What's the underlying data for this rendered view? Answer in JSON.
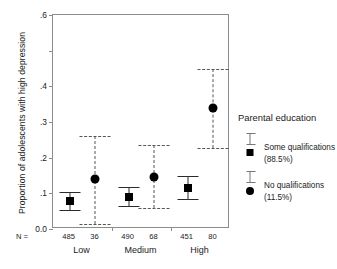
{
  "chart_data": {
    "type": "scatter",
    "title": "",
    "xlabel": "",
    "ylabel": "Proportion of adolescents with high depression",
    "categories": [
      "Low",
      "Medium",
      "High"
    ],
    "ylim": [
      0.0,
      0.6
    ],
    "yticks": [
      "0.0",
      ".1",
      ".2",
      ".3",
      ".4",
      ".6"
    ],
    "ytick_values": [
      0.0,
      0.1,
      0.2,
      0.3,
      0.4,
      0.6
    ],
    "grid": false,
    "legend_position": "right",
    "error_bars": "95% confidence interval",
    "series": [
      {
        "name": "Some qualifications",
        "percent": "(88.5%)",
        "marker": "square",
        "line_style": "solid",
        "values": [
          0.078,
          0.091,
          0.115
        ],
        "ci_low": [
          0.052,
          0.064,
          0.085
        ],
        "ci_high": [
          0.103,
          0.118,
          0.148
        ],
        "n": [
          485,
          490,
          451
        ]
      },
      {
        "name": "No qualifications",
        "percent": "(11.5%)",
        "marker": "circle",
        "line_style": "dashed",
        "values": [
          0.139,
          0.146,
          0.338
        ],
        "ci_low": [
          0.013,
          0.058,
          0.228
        ],
        "ci_high": [
          0.262,
          0.235,
          0.45
        ],
        "n": [
          36,
          68,
          80
        ]
      }
    ]
  },
  "axis": {
    "n_prefix": "N ="
  },
  "legend": {
    "title": "Parental education"
  }
}
